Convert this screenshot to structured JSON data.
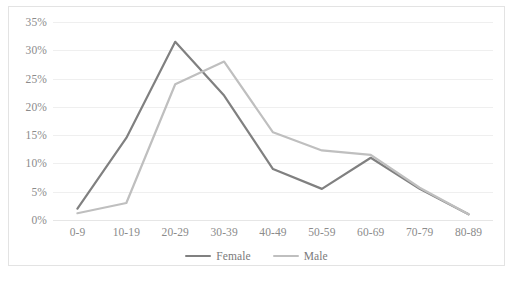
{
  "chart_data": {
    "type": "line",
    "title": "",
    "xlabel": "",
    "ylabel": "",
    "categories": [
      "0-9",
      "10-19",
      "20-29",
      "30-39",
      "40-49",
      "50-59",
      "60-69",
      "70-79",
      "80-89"
    ],
    "series": [
      {
        "name": "Female",
        "color": "#808080",
        "values": [
          2.0,
          14.5,
          31.5,
          22.0,
          9.0,
          5.5,
          11.0,
          5.5,
          1.0
        ]
      },
      {
        "name": "Male",
        "color": "#bfbfbf",
        "values": [
          1.2,
          3.0,
          24.0,
          28.0,
          15.5,
          12.3,
          11.5,
          5.7,
          1.0
        ]
      }
    ],
    "ylim": [
      0,
      35
    ],
    "yticks": [
      0,
      5,
      10,
      15,
      20,
      25,
      30,
      35
    ],
    "ytick_labels": [
      "0%",
      "5%",
      "10%",
      "15%",
      "20%",
      "25%",
      "30%",
      "35%"
    ],
    "grid": true,
    "legend_position": "bottom",
    "axis_label_color": "#8b8b8b",
    "gridline_color": "#efefef",
    "border_color": "#e3e3e3"
  },
  "legend": {
    "items": [
      {
        "label": "Female"
      },
      {
        "label": "Male"
      }
    ]
  }
}
